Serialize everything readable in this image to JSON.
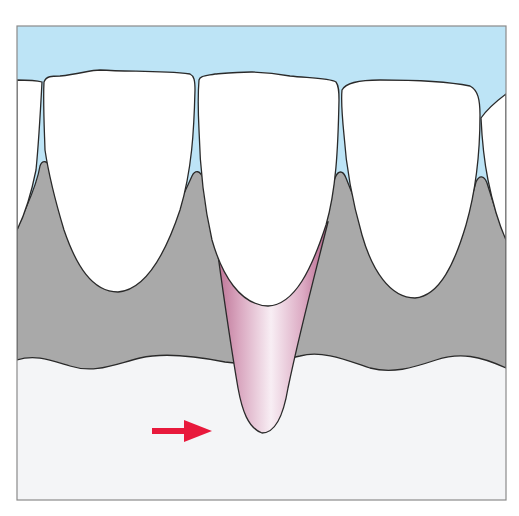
{
  "figure": {
    "colors": {
      "background": "#ffffff",
      "frame": "#8a8a8a",
      "soft_tissue_blue": "#bde4f6",
      "crown_white": "#ffffff",
      "bone_gray": "#a9a9a9",
      "lower_tissue": "#f4f5f7",
      "root_pink_dark": "#b86a8e",
      "root_pink_light": "#f8eef4",
      "outline": "#2a2a2a",
      "arrow_red": "#e8193c"
    },
    "elements": {
      "teeth_count_visible": 5,
      "highlighted_root": "center tooth",
      "arrow_direction": "right"
    }
  }
}
